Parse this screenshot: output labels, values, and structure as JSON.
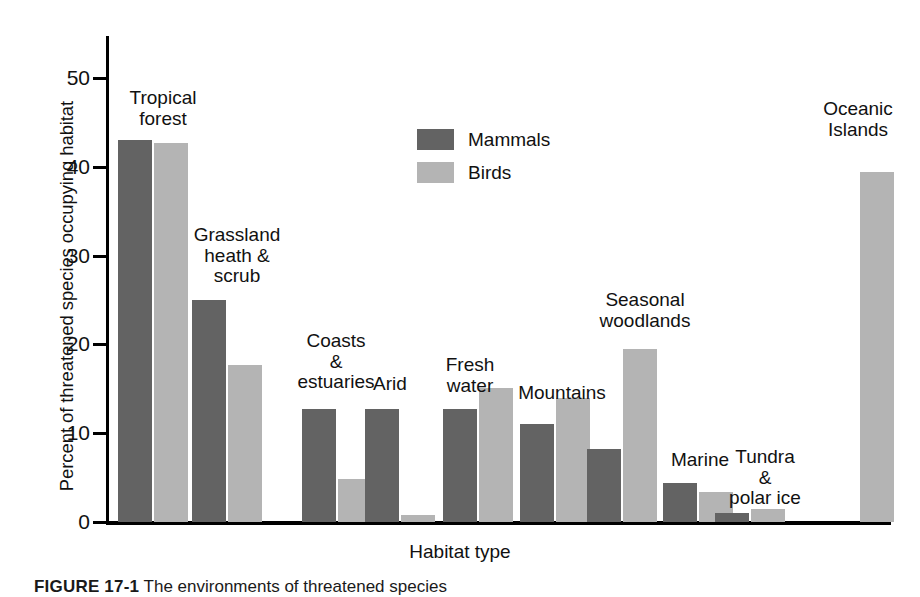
{
  "chart_data": {
    "type": "bar",
    "title": "",
    "xlabel": "Habitat type",
    "ylabel": "Percent of threatened species occupying habitat",
    "ylim": [
      0,
      55
    ],
    "yticks": [
      0,
      10,
      20,
      30,
      40,
      50
    ],
    "grid": false,
    "legend_position": "upper-center",
    "categories": [
      "Tropical forest",
      "Grassland heath & scrub",
      "Coasts & estuaries",
      "Arid",
      "Fresh water",
      "Mountains",
      "Seasonal woodlands",
      "Marine",
      "Tundra & polar ice",
      "Oceanic Islands"
    ],
    "category_labels": [
      "Tropical\nforest",
      "Grassland\nheath &\nscrub",
      "Coasts\n&\nestuaries",
      "Arid",
      "Fresh\nwater",
      "Mountains",
      "Seasonal\nwoodlands",
      "Marine",
      "Tundra\n&\npolar ice",
      "Oceanic\nIslands"
    ],
    "series": [
      {
        "name": "Mammals",
        "color": "#636363",
        "values": [
          43.0,
          25.0,
          12.7,
          12.7,
          12.7,
          11.0,
          8.2,
          4.4,
          1.0,
          null
        ]
      },
      {
        "name": "Birds",
        "color": "#b4b4b4",
        "values": [
          42.7,
          17.7,
          4.8,
          0.8,
          15.1,
          14.0,
          19.5,
          3.4,
          1.5,
          39.4
        ]
      }
    ]
  },
  "legend": {
    "items": [
      {
        "label": "Mammals",
        "swatch": "mammals"
      },
      {
        "label": "Birds",
        "swatch": "birds"
      }
    ]
  },
  "caption": {
    "figure_number": "FIGURE 17-1",
    "text": "The environments of threatened species"
  }
}
